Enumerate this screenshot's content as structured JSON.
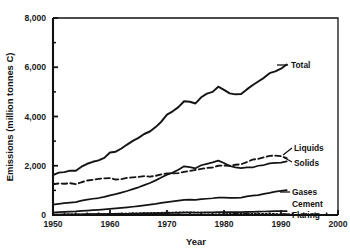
{
  "chart_data": {
    "type": "line",
    "title": "",
    "subtitle": "",
    "xlabel": "Year",
    "ylabel": "Emissions (million tonnes C)",
    "xlim": [
      1950,
      2000
    ],
    "ylim": [
      0,
      8000
    ],
    "grid": false,
    "legend_position": "right-inline-labels",
    "x_ticks": [
      "1950",
      "1960",
      "1970",
      "1980",
      "1990",
      "2000"
    ],
    "x_tick_values": [
      1950,
      1960,
      1970,
      1980,
      1990,
      2000
    ],
    "x_minor_interval": 2,
    "y_ticks": [
      "0",
      "2,000",
      "4,000",
      "6,000",
      "8,000"
    ],
    "y_tick_values": [
      0,
      2000,
      4000,
      6000,
      8000
    ],
    "y_minor_values": [
      1000,
      3000,
      5000,
      7000
    ],
    "x": [
      1950,
      1951,
      1952,
      1953,
      1954,
      1955,
      1956,
      1957,
      1958,
      1959,
      1960,
      1961,
      1962,
      1963,
      1964,
      1965,
      1966,
      1967,
      1968,
      1969,
      1970,
      1971,
      1972,
      1973,
      1974,
      1975,
      1976,
      1977,
      1978,
      1979,
      1980,
      1981,
      1982,
      1983,
      1984,
      1985,
      1986,
      1987,
      1988,
      1989,
      1990,
      1991
    ],
    "series": [
      {
        "name": "Total",
        "label": "Total",
        "style": "solid",
        "values": [
          1620,
          1720,
          1740,
          1800,
          1800,
          1960,
          2080,
          2160,
          2220,
          2320,
          2540,
          2570,
          2700,
          2860,
          3010,
          3130,
          3290,
          3390,
          3570,
          3790,
          4080,
          4210,
          4380,
          4620,
          4600,
          4530,
          4780,
          4930,
          5000,
          5210,
          5080,
          4940,
          4900,
          4910,
          5100,
          5270,
          5420,
          5570,
          5760,
          5830,
          5940,
          6110
        ]
      },
      {
        "name": "Liquids",
        "label": "Liquids",
        "style": "solid",
        "values": [
          420,
          455,
          480,
          505,
          525,
          580,
          625,
          660,
          690,
          740,
          800,
          845,
          910,
          975,
          1050,
          1125,
          1215,
          1300,
          1405,
          1520,
          1640,
          1720,
          1835,
          1975,
          1940,
          1895,
          2020,
          2080,
          2140,
          2210,
          2110,
          1990,
          1930,
          1900,
          1930,
          1930,
          2000,
          2030,
          2100,
          2120,
          2130,
          2180
        ]
      },
      {
        "name": "Solids",
        "label": "Solids",
        "style": "dashed",
        "values": [
          1250,
          1280,
          1270,
          1290,
          1250,
          1330,
          1400,
          1430,
          1470,
          1490,
          1500,
          1440,
          1460,
          1510,
          1530,
          1550,
          1580,
          1560,
          1590,
          1650,
          1690,
          1690,
          1700,
          1750,
          1790,
          1830,
          1870,
          1910,
          1930,
          2000,
          2010,
          2000,
          2040,
          2060,
          2150,
          2250,
          2280,
          2340,
          2400,
          2410,
          2390,
          2310
        ]
      },
      {
        "name": "Gases",
        "label": "Gases",
        "style": "solid",
        "values": [
          100,
          115,
          125,
          140,
          150,
          165,
          180,
          195,
          210,
          230,
          250,
          265,
          285,
          310,
          335,
          360,
          390,
          420,
          450,
          490,
          520,
          550,
          580,
          610,
          620,
          610,
          640,
          660,
          680,
          710,
          710,
          700,
          700,
          710,
          760,
          790,
          810,
          860,
          900,
          950,
          980,
          1010
        ]
      },
      {
        "name": "Cement",
        "label": "Cement",
        "style": "solid",
        "values": [
          18,
          20,
          22,
          24,
          26,
          28,
          31,
          33,
          36,
          39,
          42,
          44,
          47,
          50,
          54,
          58,
          62,
          65,
          70,
          75,
          79,
          83,
          88,
          93,
          94,
          93,
          99,
          104,
          110,
          115,
          117,
          116,
          117,
          121,
          126,
          131,
          136,
          142,
          148,
          153,
          157,
          160
        ]
      },
      {
        "name": "Flaring",
        "label": "Flaring",
        "style": "dotted",
        "values": [
          20,
          22,
          24,
          27,
          29,
          33,
          37,
          41,
          44,
          48,
          53,
          56,
          60,
          64,
          69,
          74,
          80,
          85,
          90,
          96,
          102,
          106,
          110,
          114,
          110,
          105,
          100,
          95,
          90,
          85,
          80,
          72,
          66,
          62,
          58,
          55,
          52,
          50,
          48,
          46,
          45,
          44
        ]
      }
    ]
  }
}
